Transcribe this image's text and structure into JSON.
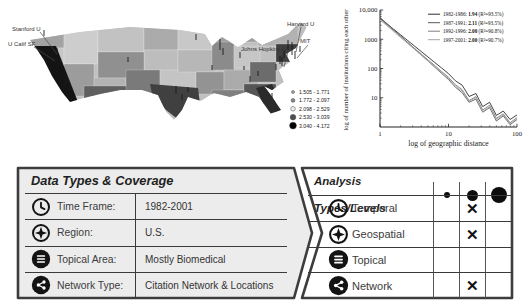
{
  "map": {
    "labels": [
      "Stanford U",
      "U Calif SF",
      "Harvard U",
      "MIT",
      "Johns Hopkins U"
    ],
    "legend": [
      "1.505 - 1.771",
      "1.772 - 2.097",
      "2.098 - 2.529",
      "2.530 - 3.039",
      "3.040 - 4.172"
    ],
    "shade_palette": [
      "#c6c6c6",
      "#a8a8a8",
      "#8a8a8a",
      "#5f5f5f",
      "#3f3f3f",
      "#141414"
    ]
  },
  "chart_data": {
    "type": "line",
    "x_scale": "log",
    "y_scale": "log",
    "xlabel": "log of geographic distance",
    "ylabel": "log of number of institutions citing each other",
    "xlim": [
      1,
      100
    ],
    "ylim": [
      1,
      10000
    ],
    "x_ticks": [
      1,
      10,
      100
    ],
    "x_tick_labels": [
      "1",
      "10",
      "100"
    ],
    "y_ticks": [
      10,
      100,
      1000,
      10000
    ],
    "y_tick_labels": [
      "10",
      "100",
      "1000",
      "10,000"
    ],
    "legend_position": "top-right",
    "x": [
      1,
      1.26,
      1.58,
      2,
      2.51,
      3.16,
      3.98,
      5.01,
      6.31,
      7.94,
      10,
      12.6,
      15.8,
      20,
      25.1,
      31.6,
      39.8,
      50.1,
      63.1,
      79.4,
      100
    ],
    "series": [
      {
        "name": "1982-1986",
        "exponent": "1.94",
        "r2": "93.5%",
        "color": "#2e2e2e",
        "values": [
          5200,
          3350,
          2200,
          1420,
          920,
          595,
          385,
          250,
          160,
          104,
          67,
          38,
          27,
          11,
          14,
          5,
          7,
          2.5,
          3.5,
          1.8,
          2.6
        ]
      },
      {
        "name": "1987-1991",
        "exponent": "2.11",
        "r2": "93.5%",
        "color": "#595959",
        "values": [
          5600,
          3430,
          2100,
          1290,
          790,
          485,
          297,
          182,
          112,
          68,
          42,
          23,
          15,
          7,
          9,
          3.2,
          4.6,
          1.6,
          2.4,
          1.2,
          1.8
        ]
      },
      {
        "name": "1992-1996",
        "exponent": "2.00",
        "r2": "90.8%",
        "color": "#7f7f7f",
        "values": [
          5000,
          3150,
          2000,
          1250,
          790,
          500,
          316,
          199,
          126,
          79,
          50,
          28,
          19,
          8,
          11,
          3.8,
          5.5,
          2,
          2.8,
          1.4,
          2.1
        ]
      },
      {
        "name": "1997-2001",
        "exponent": "2.00",
        "r2": "90.7%",
        "color": "#a6a6a6",
        "values": [
          4600,
          2900,
          1840,
          1150,
          727,
          460,
          290,
          183,
          116,
          73,
          46,
          25,
          17,
          7.5,
          10,
          3.4,
          5,
          1.8,
          2.6,
          1.3,
          1.9
        ]
      }
    ]
  },
  "data_panel": {
    "title": "Data Types & Coverage",
    "rows": [
      {
        "icon": "clock",
        "label": "Time Frame:",
        "value": "1982-2001"
      },
      {
        "icon": "geospatial",
        "label": "Region:",
        "value": "U.S."
      },
      {
        "icon": "topical",
        "label": "Topical Area:",
        "value": "Mostly Biomedical"
      },
      {
        "icon": "network",
        "label": "Network Type:",
        "value": "Citation Network & Locations"
      }
    ]
  },
  "analysis_panel": {
    "title": "Analysis Types/Levels",
    "levels": [
      "small",
      "medium",
      "large"
    ],
    "mark_glyph": "✕",
    "rows": [
      {
        "icon": "clock",
        "label": "Temporal",
        "marks": [
          false,
          true,
          false
        ]
      },
      {
        "icon": "geospatial",
        "label": "Geospatial",
        "marks": [
          false,
          true,
          false
        ]
      },
      {
        "icon": "topical",
        "label": "Topical",
        "marks": [
          false,
          false,
          false
        ]
      },
      {
        "icon": "network",
        "label": "Network",
        "marks": [
          false,
          true,
          false
        ]
      }
    ]
  },
  "colors": {
    "panel_border": "#3d3d3d",
    "data_panel_fill": "#ececec",
    "analysis_panel_fill": "#ffffff",
    "text_dark": "#1f1f1f"
  }
}
